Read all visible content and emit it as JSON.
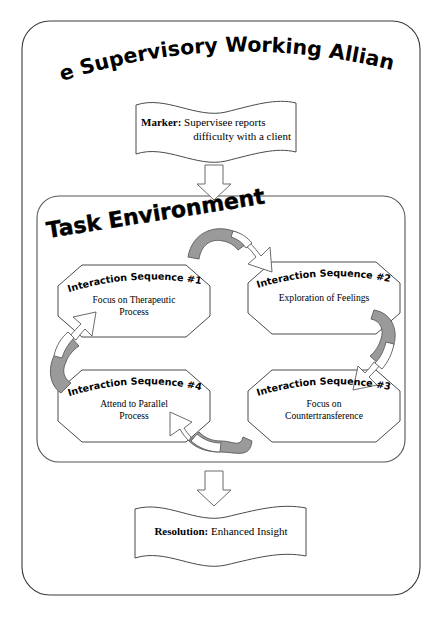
{
  "diagram": {
    "title": "The Supervisory Working Alliance",
    "task_environment_label": "Task Environment",
    "marker": {
      "label": "Marker:",
      "text_line1": "Supervisee reports",
      "text_line2": "difficulty with a client"
    },
    "resolution": {
      "label": "Resolution:",
      "text": "Enhanced Insight"
    },
    "nodes": [
      {
        "heading": "Interaction Sequence #1",
        "line1": "Focus on Therapeutic",
        "line2": "Process"
      },
      {
        "heading": "Interaction Sequence #2",
        "line1": "Exploration of Feelings",
        "line2": ""
      },
      {
        "heading": "Interaction Sequence #3",
        "line1": "Focus on",
        "line2": "Countertransference"
      },
      {
        "heading": "Interaction Sequence #4",
        "line1": "Attend to Parallel",
        "line2": "Process"
      }
    ],
    "arrows": {
      "marker_to_task": "down-block-arrow",
      "task_to_resolution": "down-block-arrow",
      "cycle_top": "curved-arrow-right",
      "cycle_right": "curved-arrow-down",
      "cycle_bottom": "curved-arrow-left",
      "cycle_left": "curved-arrow-up"
    },
    "colors": {
      "background": "#ffffff",
      "outline": "#4a4a4a",
      "arrow_shade": "#9a9a9a",
      "text": "#000000"
    }
  }
}
